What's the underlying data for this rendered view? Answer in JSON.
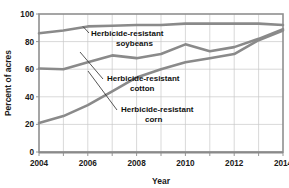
{
  "chart_data": {
    "type": "line",
    "title": "",
    "xlabel": "Year",
    "ylabel": "Percent of acres",
    "x": [
      2004,
      2005,
      2006,
      2007,
      2008,
      2009,
      2010,
      2011,
      2012,
      2013,
      2014
    ],
    "xlim": [
      2004,
      2014
    ],
    "ylim": [
      0,
      100
    ],
    "xticks": [
      2004,
      2006,
      2008,
      2010,
      2012,
      2014
    ],
    "xtick_labels": [
      "2004",
      "2006",
      "2008",
      "2010",
      "2012",
      "2014"
    ],
    "yticks": [
      0,
      20,
      40,
      60,
      80,
      100
    ],
    "ytick_labels": [
      "0",
      "20",
      "40",
      "60",
      "80",
      "100"
    ],
    "grid": true,
    "legend_position": "inline-annotations",
    "series": [
      {
        "name": "Herbicide-resistant soybeans",
        "label_line1": "Herbicide-resistant",
        "label_line2": "soybeans",
        "color": "#8a8a8a",
        "values": [
          86,
          88,
          91,
          91.5,
          92,
          92,
          93,
          93,
          93,
          93,
          92
        ]
      },
      {
        "name": "Herbicide-resistant cotton",
        "label_line1": "Herbicide-resistant",
        "label_line2": "cotton",
        "color": "#8a8a8a",
        "values": [
          60.5,
          60,
          65,
          70,
          68,
          71,
          78,
          73,
          76,
          82,
          89
        ]
      },
      {
        "name": "Herbicide-resistant corn",
        "label_line1": "Herbicide-resistant",
        "label_line2": "corn",
        "color": "#8a8a8a",
        "values": [
          21,
          26,
          34,
          44,
          54,
          60,
          65,
          68,
          71,
          81,
          88
        ]
      }
    ]
  },
  "axes": {
    "y_title": "Percent of acres",
    "x_title": "Year",
    "y_labels": [
      "100",
      "80",
      "60",
      "40",
      "20",
      "0"
    ],
    "x_labels": [
      "2004",
      "2006",
      "2008",
      "2010",
      "2012",
      "2014"
    ]
  },
  "annotations": {
    "soybeans": {
      "line1": "Herbicide-resistant",
      "line2": "soybeans"
    },
    "cotton": {
      "line1": "Herbicide-resistant",
      "line2": "cotton"
    },
    "corn": {
      "line1": "Herbicide-resistant",
      "line2": "corn"
    }
  },
  "colors": {
    "line": "#8a8a8a",
    "grid": "#c9c9c9",
    "frame": "#8f8f8f",
    "text": "#1a1a1a",
    "background": "#ffffff"
  }
}
